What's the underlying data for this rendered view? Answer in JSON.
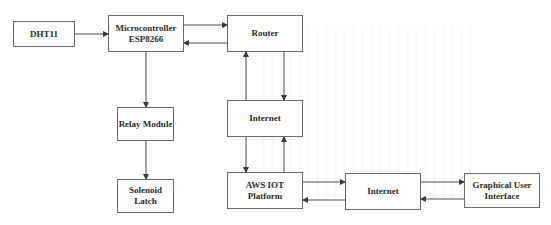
{
  "diagram": {
    "type": "block-diagram",
    "nodes": [
      {
        "id": "dht11",
        "label": "DHT11"
      },
      {
        "id": "mcu",
        "label": "Microcontroller\nESP8266"
      },
      {
        "id": "router",
        "label": "Router"
      },
      {
        "id": "internet1",
        "label": "Internet"
      },
      {
        "id": "relay",
        "label": "Relay Module"
      },
      {
        "id": "solenoid",
        "label": "Solenoid\nLatch"
      },
      {
        "id": "aws",
        "label": "AWS IOT\nPlatform"
      },
      {
        "id": "internet2",
        "label": "Internet"
      },
      {
        "id": "gui",
        "label": "Graphical User\nInterface"
      }
    ],
    "edges": [
      {
        "from": "dht11",
        "to": "mcu"
      },
      {
        "from": "mcu",
        "to": "router"
      },
      {
        "from": "router",
        "to": "mcu"
      },
      {
        "from": "mcu",
        "to": "relay"
      },
      {
        "from": "relay",
        "to": "solenoid"
      },
      {
        "from": "router",
        "to": "internet1"
      },
      {
        "from": "internet1",
        "to": "router"
      },
      {
        "from": "internet1",
        "to": "aws"
      },
      {
        "from": "aws",
        "to": "internet1"
      },
      {
        "from": "aws",
        "to": "internet2"
      },
      {
        "from": "internet2",
        "to": "aws"
      },
      {
        "from": "internet2",
        "to": "gui"
      },
      {
        "from": "gui",
        "to": "internet2"
      }
    ],
    "colors": {
      "line": "#3a3a3a",
      "border": "#6a6a6a",
      "text": "#2a2a2a",
      "background": "#ffffff"
    }
  }
}
